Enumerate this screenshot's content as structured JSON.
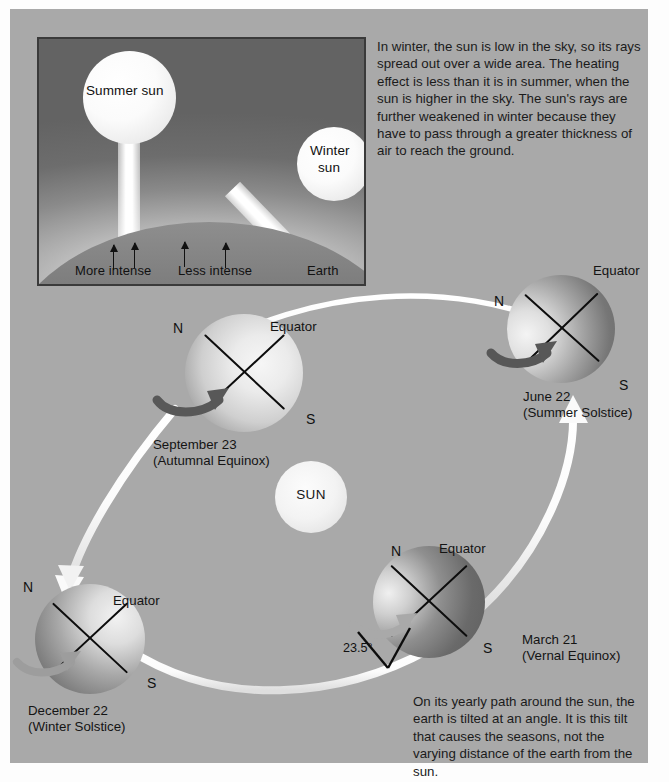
{
  "figure": {
    "title_semantic": "earth-seasons-diagram",
    "background_color": "#a9a9a9",
    "accent_white": "#ffffff",
    "ink_color": "#111111"
  },
  "inset": {
    "name": "sun-angle-inset",
    "summer_sun_label": "Summer sun",
    "winter_sun_label_line1": "Winter",
    "winter_sun_label_line2": "sun",
    "more_intense_label": "More intense",
    "less_intense_label": "Less intense",
    "earth_label": "Earth",
    "arrow_count": 4
  },
  "text": {
    "top_paragraph": "In winter, the sun is low in the sky, so its rays spread out over a wide area. The heating effect is less than it is in summer, when the sun is higher in the sky. The sun's rays are further weakened in winter because they have to pass through a greater thickness of air to reach the ground.",
    "bottom_paragraph": "On its yearly path around the sun, the earth is tilted at an angle. It is this tilt that causes the seasons, not the varying distance of the earth from the sun."
  },
  "sun": {
    "label": "SUN"
  },
  "tilt": {
    "angle_label": "23.5°"
  },
  "globes": [
    {
      "id": "june-22",
      "date": "June 22",
      "event": "(Summer Solstice)",
      "north_label": "N",
      "south_label": "S",
      "equator_label": "Equator"
    },
    {
      "id": "september-23",
      "date": "September 23",
      "event": "(Autumnal Equinox)",
      "north_label": "N",
      "south_label": "S",
      "equator_label": "Equator"
    },
    {
      "id": "december-22",
      "date": "December 22",
      "event": "(Winter Solstice)",
      "north_label": "N",
      "south_label": "S",
      "equator_label": "Equator"
    },
    {
      "id": "march-21",
      "date": "March 21",
      "event": "(Vernal Equinox)",
      "north_label": "N",
      "south_label": "S",
      "equator_label": "Equator"
    }
  ]
}
